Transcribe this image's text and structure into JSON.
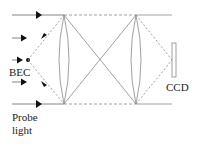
{
  "labels": {
    "bec": "BEC",
    "ccd": "CCD",
    "probe_line1": "Probe",
    "probe_line2": "light"
  },
  "colors": {
    "line": "#888888",
    "arrow": "#111111",
    "background": "#ffffff"
  }
}
